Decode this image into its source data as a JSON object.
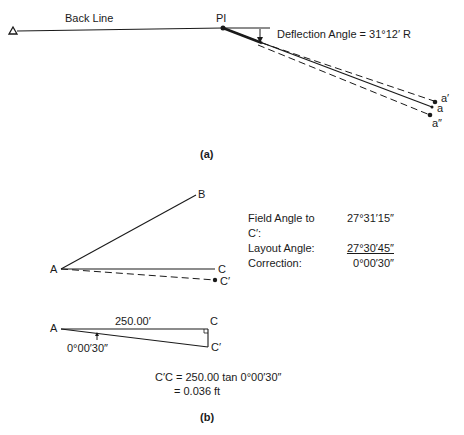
{
  "figure_a": {
    "caption": "(a)",
    "back_line_label": "Back Line",
    "pi_label": "PI",
    "deflection_label": "Deflection Angle = 31°12′ R",
    "points": {
      "a_prime": "a′",
      "a": "a",
      "a_double_prime": "a″"
    }
  },
  "figure_b": {
    "caption": "(b)",
    "points": {
      "A": "A",
      "B": "B",
      "C": "C",
      "C_prime": "C′"
    },
    "table": [
      {
        "label": "Field Angle to C′:",
        "value": "27°31′15″"
      },
      {
        "label": "Layout Angle:",
        "value": "27°30′45″"
      },
      {
        "label": "Correction:",
        "value": "0°00′30″"
      }
    ],
    "triangle": {
      "A": "A",
      "C": "C",
      "C_prime": "C′",
      "distance": "250.00′",
      "angle": "0°00′30″"
    },
    "equation_line1": "C′C = 250.00 tan 0°00′30″",
    "equation_line2": "= 0.036 ft"
  }
}
